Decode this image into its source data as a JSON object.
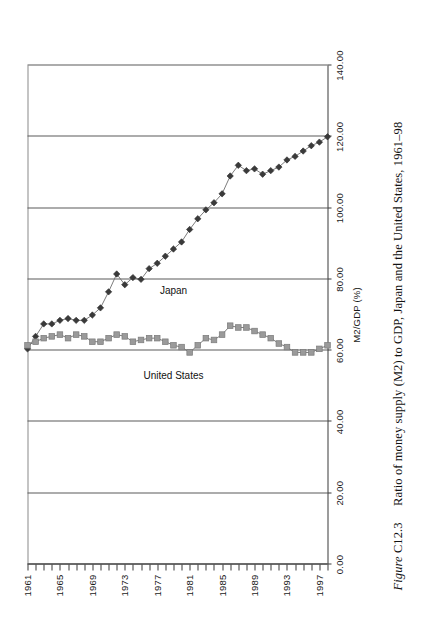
{
  "caption": {
    "figure_word": "Figure",
    "figure_number": "C12.3",
    "text": "Ratio of money supply (M2) to GDP, Japan and the United States, 1961–98"
  },
  "chart_data": {
    "type": "line",
    "title": "",
    "xlabel": "",
    "ylabel": "M2/GDP (%)",
    "ylim": [
      0,
      140
    ],
    "ytick_labels": [
      "0.00",
      "20.00",
      "40.00",
      "60.00",
      "80.00",
      "100.00",
      "120.00",
      "140.00"
    ],
    "ytick_values": [
      0,
      20,
      40,
      60,
      80,
      100,
      120,
      140
    ],
    "grid": "value-gridlines-only",
    "legend": "inline-series-labels",
    "orientation": "page-rotated-90",
    "x": [
      1961,
      1962,
      1963,
      1964,
      1965,
      1966,
      1967,
      1968,
      1969,
      1970,
      1971,
      1972,
      1973,
      1974,
      1975,
      1976,
      1977,
      1978,
      1979,
      1980,
      1981,
      1982,
      1983,
      1984,
      1985,
      1986,
      1987,
      1988,
      1989,
      1990,
      1991,
      1992,
      1993,
      1994,
      1995,
      1996,
      1997,
      1998
    ],
    "xtick_labels": [
      "1961",
      "1965",
      "1969",
      "1973",
      "1977",
      "1981",
      "1985",
      "1989",
      "1993",
      "1997"
    ],
    "xtick_values": [
      1961,
      1965,
      1969,
      1973,
      1977,
      1981,
      1985,
      1989,
      1993,
      1997
    ],
    "series": [
      {
        "name": "Japan",
        "marker": "diamond",
        "color": "#3a3a3a",
        "values": [
          60.5,
          64.0,
          67.5,
          67.5,
          68.5,
          69.0,
          68.5,
          68.5,
          70.0,
          72.0,
          76.5,
          81.5,
          78.5,
          80.5,
          80.0,
          83.0,
          84.5,
          86.5,
          88.5,
          90.5,
          94.0,
          97.0,
          99.5,
          101.5,
          104.0,
          109.0,
          112.0,
          110.5,
          111.0,
          109.5,
          110.5,
          111.5,
          113.5,
          114.5,
          116.0,
          117.5,
          118.5,
          120.0
        ]
      },
      {
        "name": "United States",
        "marker": "square",
        "color": "#9a9a9a",
        "values": [
          61.5,
          62.5,
          63.5,
          64.0,
          64.5,
          63.5,
          64.5,
          64.0,
          62.5,
          62.5,
          63.5,
          64.5,
          64.0,
          62.5,
          63.0,
          63.5,
          63.5,
          62.5,
          61.5,
          61.0,
          59.5,
          61.5,
          63.5,
          63.0,
          64.5,
          67.0,
          66.5,
          66.5,
          65.5,
          64.5,
          63.5,
          62.0,
          61.0,
          59.5,
          59.5,
          59.5,
          60.5,
          61.5
        ]
      }
    ],
    "series_labels": [
      {
        "name": "Japan",
        "at_year": 1979,
        "at_value": 77.0
      },
      {
        "name": "United States",
        "at_year": 1979,
        "at_value": 53.0
      }
    ]
  }
}
